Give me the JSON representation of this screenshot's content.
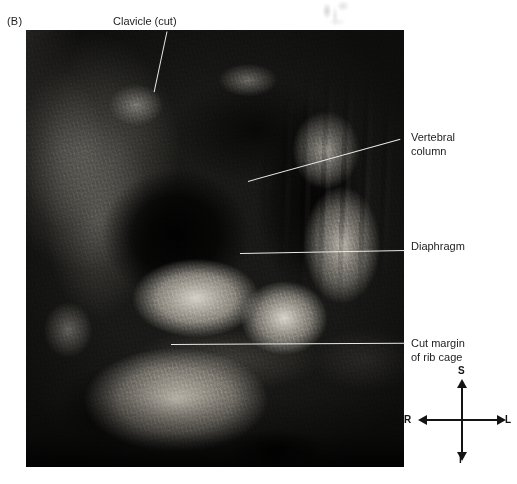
{
  "figure": {
    "panel_letter": "(B)",
    "caption_labels": {
      "clavicle": "Clavicle (cut)",
      "vertebral_column": "Vertebral\ncolumn",
      "diaphragm": "Diaphragm",
      "cut_margin": "Cut margin\nof rib cage"
    }
  },
  "photograph": {
    "subject": "cadaver-thoracic-dissection",
    "background_color": "#0b0b0b"
  },
  "compass": {
    "superior": "S",
    "inferior": "I",
    "right": "R",
    "left": "L",
    "stroke_color": "#141414"
  },
  "colors": {
    "page_background": "#ffffff",
    "text": "#1d1d1d",
    "leader_dark": "#111111",
    "leader_light": "#e9e9e9"
  }
}
